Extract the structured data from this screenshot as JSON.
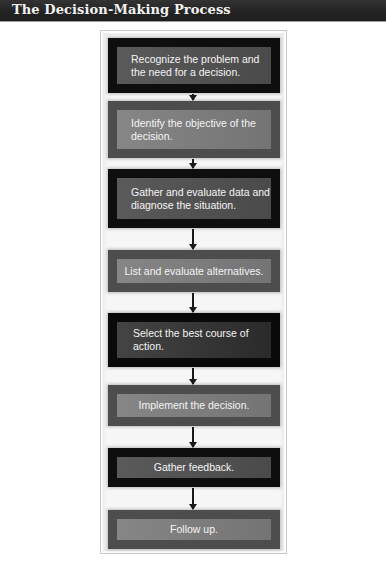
{
  "header": {
    "title": "The Decision-Making Process"
  },
  "diagram": {
    "type": "flowchart",
    "direction": "top-to-bottom",
    "steps": [
      {
        "label": "Recognize the problem and the need for a decision.",
        "shade": "dark"
      },
      {
        "label": "Identify the objective of the decision.",
        "shade": "mid"
      },
      {
        "label": "Gather and evaluate data and diagnose the situation.",
        "shade": "dark"
      },
      {
        "label": "List and evaluate alternatives.",
        "shade": "mid"
      },
      {
        "label": "Select the best course of action.",
        "shade": "darkest"
      },
      {
        "label": "Implement the decision.",
        "shade": "mid"
      },
      {
        "label": "Gather feedback.",
        "shade": "dark"
      },
      {
        "label": "Follow up.",
        "shade": "mid"
      }
    ],
    "connectors": [
      {
        "from": 0,
        "to": 1,
        "icon": "arrow-down-icon"
      },
      {
        "from": 1,
        "to": 2,
        "icon": "arrow-down-icon"
      },
      {
        "from": 2,
        "to": 3,
        "icon": "arrow-down-icon"
      },
      {
        "from": 3,
        "to": 4,
        "icon": "arrow-down-icon"
      },
      {
        "from": 4,
        "to": 5,
        "icon": "arrow-down-icon"
      },
      {
        "from": 5,
        "to": 6,
        "icon": "arrow-down-icon"
      },
      {
        "from": 6,
        "to": 7,
        "icon": "arrow-down-icon"
      }
    ]
  },
  "colors": {
    "header_bg": "#262626",
    "header_text": "#f2f2f2",
    "box_dark_outer": "#0e0e0e",
    "box_dark_inner": "#555555",
    "box_mid_outer": "#4d4d4d",
    "box_mid_inner": "#7e7e7e",
    "box_text": "#f4f4f4",
    "arrow": "#1a1a1a"
  }
}
